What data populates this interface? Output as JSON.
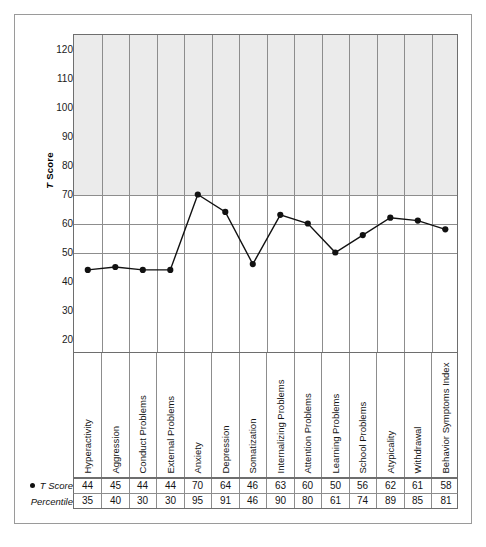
{
  "chart_data": {
    "type": "line",
    "title": "",
    "xlabel": "",
    "ylabel": "T Score",
    "ylim": [
      15,
      125
    ],
    "yticks": [
      120,
      110,
      100,
      90,
      80,
      70,
      60,
      50,
      40,
      30,
      20
    ],
    "gridlines_horizontal": [
      70,
      60,
      50
    ],
    "shaded_region": {
      "from": 70,
      "to": 125,
      "color": "#ebebeb"
    },
    "grid": true,
    "legend_position": "none",
    "marker": "filled-circle",
    "categories": [
      "Hyperactivity",
      "Aggression",
      "Conduct Problems",
      "External Problems",
      "Anxiety",
      "Depression",
      "Somatization",
      "Internalizing Problems",
      "Attention Problems",
      "Learning Problems",
      "School Problems",
      "Atypicality",
      "Withdrawal",
      "Behavior Symptoms Index"
    ],
    "series": [
      {
        "name": "T Score",
        "values": [
          44,
          45,
          44,
          44,
          70,
          64,
          46,
          63,
          60,
          50,
          56,
          62,
          61,
          58
        ]
      }
    ],
    "percentiles": [
      35,
      40,
      30,
      30,
      95,
      91,
      46,
      90,
      80,
      61,
      74,
      89,
      85,
      81
    ]
  },
  "axis": {
    "y_title_italic": "T",
    "y_title_rest": " Score"
  },
  "table": {
    "tscore_label": "T Score",
    "percentile_label": "Percentile"
  },
  "colors": {
    "line": "#111111",
    "marker": "#111111",
    "grid": "#8d8d8d",
    "axis": "#6e6e6e",
    "shade": "#ebebeb",
    "frame": "#9a9a9a"
  }
}
